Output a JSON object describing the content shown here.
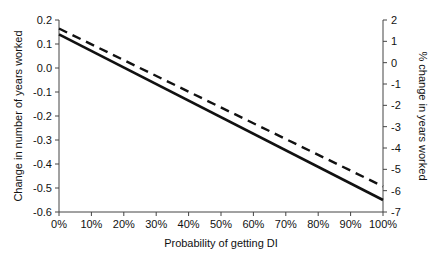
{
  "chart_data": {
    "type": "line",
    "title": "",
    "xlabel": "Probability of getting DI",
    "ylabel": "Change in number of years worked",
    "y2label": "% change in years worked",
    "x_ticks": [
      "0%",
      "10%",
      "20%",
      "30%",
      "40%",
      "50%",
      "60%",
      "70%",
      "80%",
      "90%",
      "100%"
    ],
    "y_ticks": [
      "0.2",
      "0.1",
      "0.0",
      "-0.1",
      "-0.2",
      "-0.3",
      "-0.4",
      "-0.5",
      "-0.6"
    ],
    "y2_ticks": [
      "2",
      "1",
      "0",
      "-1",
      "-2",
      "-3",
      "-4",
      "-5",
      "-6",
      "-7"
    ],
    "xlim": [
      0,
      100
    ],
    "ylim": [
      -0.6,
      0.2
    ],
    "y2lim": [
      -7,
      2
    ],
    "grid": false,
    "legend": null,
    "series": [
      {
        "name": "Change in number of years worked",
        "axis": "left",
        "style": "solid",
        "x": [
          0,
          100
        ],
        "values": [
          0.14,
          -0.55
        ]
      },
      {
        "name": "% change in years worked",
        "axis": "right",
        "style": "dashed",
        "x": [
          0,
          100
        ],
        "values": [
          1.6,
          -5.8
        ]
      }
    ]
  }
}
